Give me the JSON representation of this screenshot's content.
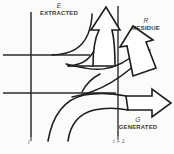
{
  "figure": {
    "kind": "schematic-flow-diagram",
    "background_color": "#fbfbfa",
    "ink_color": "#1d1d1d",
    "labels": {
      "extracted": {
        "symbol": "E",
        "text": "EXTRACTED"
      },
      "residue": {
        "symbol": "R",
        "text": "RESIDUE"
      },
      "generated": {
        "symbol": "G",
        "text": "GENERATED"
      }
    },
    "axis": {
      "left_tick_label": "t",
      "right_tick_label": "t + 1"
    },
    "grid": {
      "vertical_lines": 2,
      "horizontal_lines": 2
    },
    "arrows": [
      {
        "name": "extracted-arrow",
        "direction": "up"
      },
      {
        "name": "residue-arrow",
        "direction": "up-right"
      },
      {
        "name": "generated-arrow",
        "direction": "right"
      }
    ]
  }
}
